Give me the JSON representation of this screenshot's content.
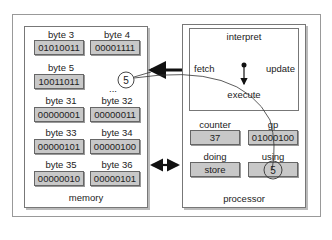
{
  "memory": {
    "title": "memory",
    "ellipsis": "...",
    "circled_value": "5",
    "bytes": [
      {
        "label": "byte 3",
        "value": "01010011"
      },
      {
        "label": "byte 4",
        "value": "00001111"
      },
      {
        "label": "byte 5",
        "value": "10011011"
      },
      {
        "label": "byte 31",
        "value": "00000001"
      },
      {
        "label": "byte 32",
        "value": "00000011"
      },
      {
        "label": "byte 33",
        "value": "00000101"
      },
      {
        "label": "byte 34",
        "value": "00000100"
      },
      {
        "label": "byte 35",
        "value": "00000010"
      },
      {
        "label": "byte 36",
        "value": "00000101"
      }
    ]
  },
  "processor": {
    "title": "processor",
    "interpret": {
      "title": "interpret",
      "fetch": "fetch",
      "update": "update",
      "execute": "execute"
    },
    "registers": {
      "counter": {
        "label": "counter",
        "value": "37"
      },
      "gp": {
        "label": "gp",
        "value": "01000100"
      },
      "doing": {
        "label": "doing",
        "value": "store"
      },
      "using": {
        "label": "using",
        "value": "5"
      }
    }
  }
}
